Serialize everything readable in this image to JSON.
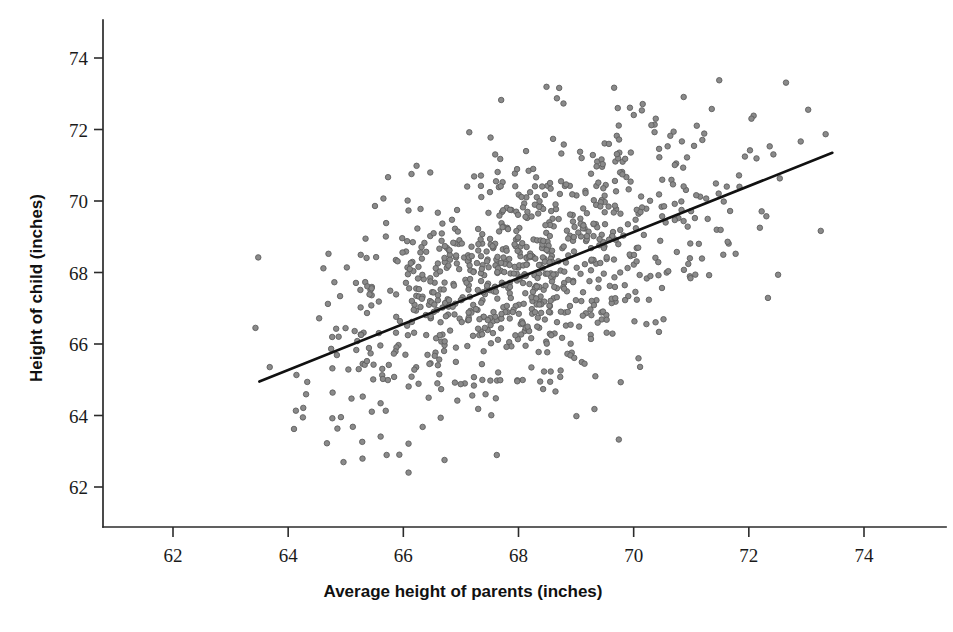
{
  "chart_data": {
    "type": "scatter",
    "title": "",
    "xlabel": "Average height of parents (inches)",
    "ylabel": "Height of child (inches)",
    "xlim": [
      61.0,
      75.2
    ],
    "ylim": [
      61.0,
      74.9
    ],
    "xticks": [
      62,
      64,
      66,
      68,
      70,
      72,
      74
    ],
    "xticklabels": [
      "62",
      "64",
      "66",
      "68",
      "70",
      "72",
      "74"
    ],
    "yticks": [
      62,
      64,
      66,
      68,
      70,
      72,
      74
    ],
    "yticklabels": [
      "62",
      "64",
      "66",
      "68",
      "70",
      "72",
      "74"
    ],
    "grid": false,
    "legend": null,
    "marker": {
      "shape": "circle",
      "size": 5.5,
      "fill": "#8a8a8a",
      "edge": "#5f5f5f"
    },
    "n_points": 928,
    "annotations": [],
    "series": [
      {
        "name": "parent-child heights",
        "type": "scatter",
        "x": [
          63.5,
          63.6,
          63.7,
          63.8,
          63.9,
          64.0,
          64.1,
          64.2,
          64.3,
          64.4,
          64.5,
          64.6,
          64.7,
          64.8,
          64.9,
          65.0,
          65.1,
          65.2,
          65.3,
          65.4,
          65.5,
          65.6,
          65.7,
          65.8,
          65.9,
          66.0,
          66.1,
          66.2,
          66.3,
          66.4,
          66.5,
          66.6,
          66.7,
          66.8,
          66.9,
          67.0,
          67.1,
          67.2,
          67.3,
          67.4,
          67.5,
          67.6,
          67.7,
          67.8,
          67.9,
          68.0,
          68.1,
          68.2,
          68.3,
          68.4,
          68.5,
          68.6,
          68.7,
          68.8,
          68.9,
          69.0,
          69.1,
          69.2,
          69.3,
          69.4,
          69.5,
          69.6,
          69.7,
          69.8,
          69.9,
          70.0,
          70.1,
          70.2,
          70.3,
          70.4,
          70.5,
          70.6,
          70.7,
          70.8,
          70.9,
          71.0,
          71.2,
          71.4,
          71.6,
          71.8,
          72.0,
          72.3,
          72.6,
          73.0,
          73.4
        ],
        "y": [
          65.0,
          65.1,
          65.2,
          65.2,
          65.3,
          65.4,
          65.4,
          65.5,
          65.6,
          65.6,
          65.7,
          65.8,
          65.8,
          65.9,
          66.0,
          66.0,
          66.1,
          66.2,
          66.2,
          66.3,
          66.4,
          66.4,
          66.5,
          66.6,
          66.6,
          66.7,
          66.8,
          66.8,
          66.9,
          67.0,
          67.0,
          67.1,
          67.2,
          67.2,
          67.3,
          67.4,
          67.4,
          67.5,
          67.6,
          67.6,
          67.7,
          67.8,
          67.8,
          67.9,
          68.0,
          68.0,
          68.1,
          68.2,
          68.2,
          68.3,
          68.4,
          68.4,
          68.5,
          68.6,
          68.6,
          68.7,
          68.8,
          68.8,
          68.9,
          69.0,
          69.0,
          69.1,
          69.2,
          69.2,
          69.3,
          69.4,
          69.4,
          69.5,
          69.6,
          69.6,
          69.7,
          69.8,
          69.8,
          69.9,
          70.0,
          70.0,
          70.2,
          70.3,
          70.4,
          70.6,
          70.7,
          70.9,
          71.1,
          71.3,
          71.4
        ]
      }
    ],
    "trendline": {
      "name": "regression line",
      "type": "line",
      "x_start": 63.5,
      "y_start": 64.95,
      "x_end": 73.45,
      "y_end": 71.35,
      "color": "#111111"
    }
  },
  "axes": {
    "x_title": "Average height of parents (inches)",
    "y_title": "Height of child (inches)",
    "x_tick_labels": [
      "62",
      "64",
      "66",
      "68",
      "70",
      "72",
      "74"
    ],
    "y_tick_labels": [
      "62",
      "64",
      "66",
      "68",
      "70",
      "72",
      "74"
    ]
  }
}
